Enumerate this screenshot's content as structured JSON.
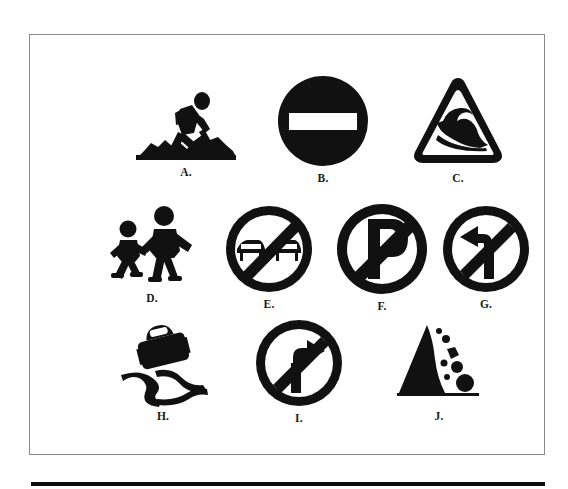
{
  "figure": {
    "type": "road-sign-identification-figure",
    "background_color": "#ffffff",
    "ink_color": "#111111",
    "frame_border_color": "#8a8a8a",
    "rule_color": "#0d0d0d",
    "rows": 3,
    "columns_per_row": [
      3,
      4,
      3
    ],
    "total_signs": 10
  },
  "signs": [
    {
      "label": "A.",
      "letter": "A",
      "icon": "roadworks-icon",
      "name": "Roadworks",
      "description": "Silhouette of a worker digging with a shovel on a mound of earth",
      "shape": "pictogram",
      "row": 1,
      "column": 1
    },
    {
      "label": "B.",
      "letter": "B",
      "icon": "no-entry-icon",
      "name": "No entry",
      "description": "Solid black disc with a white horizontal bar across the centre",
      "shape": "circle",
      "row": 1,
      "column": 2
    },
    {
      "label": "C.",
      "letter": "C",
      "icon": "wave-warning-triangle-icon",
      "name": "Wave warning",
      "description": "Rounded warning triangle outline containing a breaking wave",
      "shape": "triangle",
      "row": 1,
      "column": 3
    },
    {
      "label": "D.",
      "letter": "D",
      "icon": "children-crossing-icon",
      "name": "Children crossing",
      "description": "Silhouettes of two children walking, the taller leading the smaller",
      "shape": "pictogram",
      "row": 2,
      "column": 1
    },
    {
      "label": "E.",
      "letter": "E",
      "icon": "no-overtaking-icon",
      "name": "No overtaking",
      "description": "Two cars side by side inside a circle with a diagonal slash",
      "shape": "prohibition-circle",
      "row": 2,
      "column": 2
    },
    {
      "label": "F.",
      "letter": "F",
      "icon": "no-parking-icon",
      "name": "No parking",
      "description": "Letter P inside a circle with a diagonal slash",
      "shape": "prohibition-circle",
      "row": 2,
      "column": 3
    },
    {
      "label": "G.",
      "letter": "G",
      "icon": "no-left-turn-icon",
      "name": "No left turn",
      "description": "Arrow bending to the left inside a circle with a diagonal slash",
      "shape": "prohibition-circle",
      "row": 2,
      "column": 4
    },
    {
      "label": "H.",
      "letter": "H",
      "icon": "slippery-road-icon",
      "name": "Slippery road",
      "description": "Car silhouette above two wavy skid tracks",
      "shape": "pictogram",
      "row": 3,
      "column": 1
    },
    {
      "label": "I.",
      "letter": "I",
      "icon": "no-right-turn-icon",
      "name": "No right turn",
      "description": "Arrow bending to the right inside a circle with a diagonal slash",
      "shape": "prohibition-circle",
      "row": 3,
      "column": 2
    },
    {
      "label": "J.",
      "letter": "J",
      "icon": "falling-rocks-icon",
      "name": "Falling rocks",
      "description": "Solid triangular slope with rocks tumbling down the right side onto a baseline",
      "shape": "pictogram",
      "row": 3,
      "column": 3
    }
  ]
}
